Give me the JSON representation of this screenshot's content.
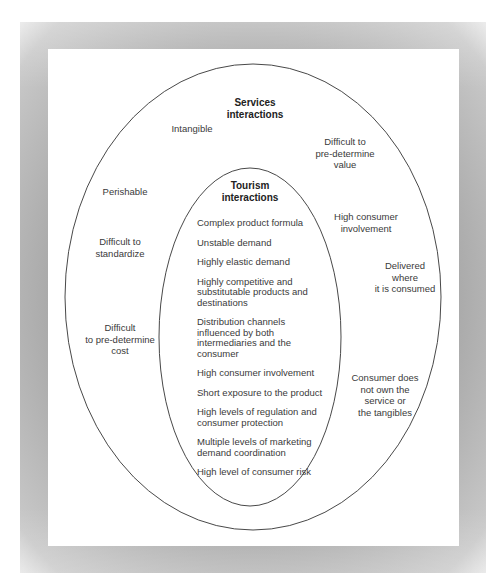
{
  "outer": {
    "title_line1": "Services",
    "title_line2": "interactions",
    "items": [
      {
        "lines": [
          "Intangible"
        ]
      },
      {
        "lines": [
          "Difficult to",
          "pre-determine",
          "value"
        ]
      },
      {
        "lines": [
          "Perishable"
        ]
      },
      {
        "lines": [
          "High consumer",
          "involvement"
        ]
      },
      {
        "lines": [
          "Difficult to",
          "standardize"
        ]
      },
      {
        "lines": [
          "Delivered",
          "where",
          "it is consumed"
        ]
      },
      {
        "lines": [
          "Difficult",
          "to pre-determine",
          "cost"
        ]
      },
      {
        "lines": [
          "Consumer does",
          "not own the",
          "service or",
          "the tangibles"
        ]
      }
    ]
  },
  "inner": {
    "title_line1": "Tourism",
    "title_line2": "interactions",
    "items": [
      {
        "lines": [
          "Complex product formula"
        ]
      },
      {
        "lines": [
          "Unstable demand"
        ]
      },
      {
        "lines": [
          "Highly elastic demand"
        ]
      },
      {
        "lines": [
          "Highly competitive and",
          "substitutable products and",
          "destinations"
        ]
      },
      {
        "lines": [
          "Distribution channels",
          "influenced by both",
          "intermediaries and the",
          "consumer"
        ]
      },
      {
        "lines": [
          "High consumer involvement"
        ]
      },
      {
        "lines": [
          "Short exposure to the product"
        ]
      },
      {
        "lines": [
          "High levels of regulation and",
          "consumer protection"
        ]
      },
      {
        "lines": [
          "Multiple levels of marketing",
          "demand coordination"
        ]
      },
      {
        "lines": [
          "High level of consumer risk"
        ]
      }
    ]
  },
  "colors": {
    "frame": "#a8a8a8",
    "panel": "#ffffff",
    "stroke": "#333333",
    "text": "#3a3a3a"
  }
}
